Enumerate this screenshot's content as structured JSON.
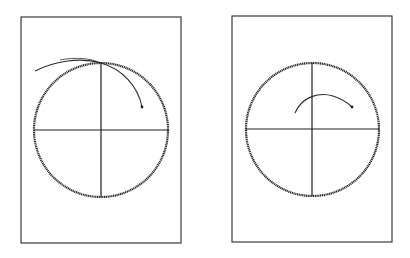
{
  "figure": {
    "panels": [
      {
        "id": "left",
        "frame": {
          "x": 21,
          "y": 17,
          "w": 160,
          "h": 226
        },
        "circle": {
          "cx": 101,
          "cy": 130,
          "r": 67
        },
        "trace": {
          "start": [
            35,
            71
          ],
          "control": [
            80,
            50
          ],
          "mid": [
            101,
            63
          ],
          "end": [
            142,
            107
          ],
          "description": "arc extending outside circle top-left, crossing at top, ending inside upper-right quadrant"
        }
      },
      {
        "id": "right",
        "frame": {
          "x": 232,
          "y": 16,
          "w": 160,
          "h": 226
        },
        "circle": {
          "cx": 312,
          "cy": 129,
          "r": 66.5
        },
        "trace": {
          "start": [
            295,
            113
          ],
          "end": [
            352,
            107
          ],
          "description": "short arc inside circle above center"
        }
      }
    ],
    "colors": {
      "line": "#2a2a2a",
      "background": "#ffffff"
    }
  }
}
